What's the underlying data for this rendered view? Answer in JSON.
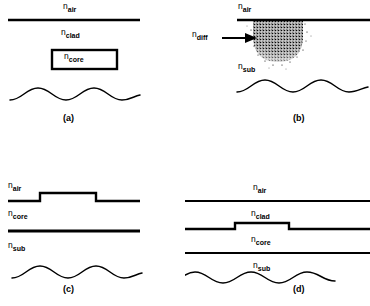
{
  "figure": {
    "type": "waveguide-cross-sections",
    "panel_count": 4
  },
  "panels": [
    {
      "id": "a",
      "caption": "(a)",
      "structure": "buried rectangular core in cladding",
      "labels": [
        {
          "base": "n",
          "sub": "air"
        },
        {
          "base": "n",
          "sub": "clad"
        },
        {
          "base": "n",
          "sub": "core"
        }
      ],
      "mode_profile": "multimode wavy field distribution"
    },
    {
      "id": "b",
      "caption": "(b)",
      "structure": "diffused index region in substrate",
      "labels": [
        {
          "base": "n",
          "sub": "air"
        },
        {
          "base": "n",
          "sub": "diff"
        },
        {
          "base": "n",
          "sub": "sub"
        }
      ],
      "mode_profile": "multimode wavy field distribution"
    },
    {
      "id": "c",
      "caption": "(c)",
      "structure": "ridge / rib waveguide",
      "labels": [
        {
          "base": "n",
          "sub": "air"
        },
        {
          "base": "n",
          "sub": "core"
        },
        {
          "base": "n",
          "sub": "sub"
        }
      ],
      "mode_profile": "multimode wavy field distribution"
    },
    {
      "id": "d",
      "caption": "(d)",
      "structure": "strip-loaded waveguide",
      "labels": [
        {
          "base": "n",
          "sub": "air"
        },
        {
          "base": "n",
          "sub": "clad"
        },
        {
          "base": "n",
          "sub": "core"
        },
        {
          "base": "n",
          "sub": "sub"
        }
      ],
      "mode_profile": "multimode wavy field distribution"
    }
  ],
  "colors": {
    "ink": "#000000",
    "background": "#ffffff"
  }
}
